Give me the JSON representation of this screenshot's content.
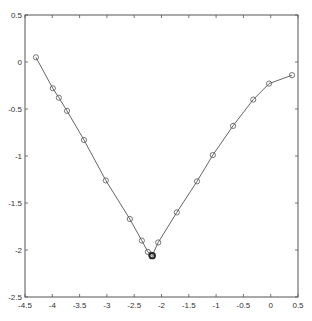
{
  "chart_data": {
    "type": "line",
    "title": "",
    "xlabel": "",
    "ylabel": "",
    "xlim": [
      -4.5,
      0.5
    ],
    "ylim": [
      -2.5,
      0.5
    ],
    "grid": false,
    "legend": null,
    "x_ticks": [
      -4.5,
      -4,
      -3.5,
      -3,
      -2.5,
      -2,
      -1.5,
      -1,
      -0.5,
      0,
      0.5
    ],
    "x_tick_labels": [
      "-4.5",
      "-4",
      "-3.5",
      "-3",
      "-2.5",
      "-2",
      "-1.5",
      "-1",
      "-0.5",
      "0",
      "0.5"
    ],
    "y_ticks": [
      0.5,
      0,
      -0.5,
      -1,
      -1.5,
      -2,
      -2.5
    ],
    "y_tick_labels": [
      "0.5",
      "0",
      "-0.5",
      "-1",
      "-1.5",
      "-2",
      "-2.5"
    ],
    "series": [
      {
        "name": "trajectory",
        "marker": "circle-open",
        "color": "#555555",
        "x": [
          -4.3,
          -3.99,
          -3.88,
          -3.73,
          -3.42,
          -3.02,
          -2.58,
          -2.36,
          -2.25,
          -2.19,
          -2.17,
          -2.06,
          -1.72,
          -1.35,
          -1.06,
          -0.69,
          -0.32,
          -0.03,
          0.39
        ],
        "y": [
          0.05,
          -0.28,
          -0.38,
          -0.52,
          -0.83,
          -1.26,
          -1.67,
          -1.9,
          -2.02,
          -2.05,
          -2.06,
          -1.92,
          -1.6,
          -1.27,
          -0.99,
          -0.68,
          -0.4,
          -0.23,
          -0.14
        ]
      }
    ],
    "highlight_point": {
      "x": -2.17,
      "y": -2.06,
      "style": "bold-circle"
    }
  },
  "plot_area": {
    "left": 25,
    "right": 298,
    "top": 15,
    "bottom": 297
  }
}
